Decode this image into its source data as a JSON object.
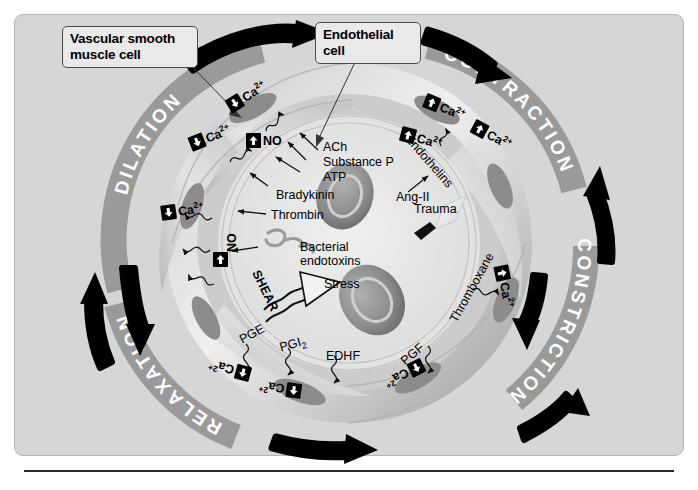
{
  "callouts": [
    {
      "id": "vsmc",
      "text": "Vascular smooth\nmuscle cell",
      "line1": "Vascular smooth",
      "line2": "muscle cell"
    },
    {
      "id": "endothelial",
      "text": "Endothelial\ncell",
      "line1": "Endothelial",
      "line2": "cell"
    }
  ],
  "ring_labels": [
    {
      "id": "dilation",
      "label": "DILATION"
    },
    {
      "id": "contraction",
      "label": "CONTRACTION"
    },
    {
      "id": "constriction",
      "label": "CONSTRICTION"
    },
    {
      "id": "relaxation",
      "label": "RELAXATION"
    }
  ],
  "vasodilator_mediators": [
    {
      "id": "ach",
      "label": "ACh"
    },
    {
      "id": "substance-p",
      "label": "Substance P"
    },
    {
      "id": "atp",
      "label": "ATP"
    },
    {
      "id": "bradykinin",
      "label": "Bradykinin"
    },
    {
      "id": "thrombin",
      "label": "Thrombin"
    },
    {
      "id": "bacterial-endotoxins-1",
      "label": "Bacterial"
    },
    {
      "id": "bacterial-endotoxins-2",
      "label": "endotoxins"
    },
    {
      "id": "shear",
      "label": "SHEAR"
    },
    {
      "id": "stress",
      "label": "Stress"
    }
  ],
  "vasodilator_products": [
    {
      "id": "pge",
      "label": "PGE"
    },
    {
      "id": "pgi2",
      "label": "PGI",
      "sub": "2"
    },
    {
      "id": "edhf",
      "label": "EDHF"
    },
    {
      "id": "no",
      "label": "NO"
    }
  ],
  "vasoconstrictor_mediators": [
    {
      "id": "ang-ii",
      "label": "Ang-II"
    },
    {
      "id": "trauma",
      "label": "Trauma"
    }
  ],
  "vasoconstrictor_products": [
    {
      "id": "endothelins",
      "label": "Endothelins"
    },
    {
      "id": "thromboxane",
      "label": "Thromboxane"
    },
    {
      "id": "pgf",
      "label": "PGF"
    }
  ],
  "calcium_badges": [
    {
      "id": "ca-top-left-1",
      "label": "Ca",
      "charge": "2+",
      "direction": "down"
    },
    {
      "id": "ca-top-left-2",
      "label": "Ca",
      "charge": "2+",
      "direction": "down"
    },
    {
      "id": "ca-left",
      "label": "Ca",
      "charge": "2+",
      "direction": "down"
    },
    {
      "id": "ca-bottom-left-1",
      "label": "Ca",
      "charge": "2+",
      "direction": "down"
    },
    {
      "id": "ca-bottom-left-2",
      "label": "Ca",
      "charge": "2+",
      "direction": "down"
    },
    {
      "id": "ca-top-right-1",
      "label": "Ca",
      "charge": "2+",
      "direction": "up"
    },
    {
      "id": "ca-top-right-2",
      "label": "Ca",
      "charge": "2+",
      "direction": "up"
    },
    {
      "id": "ca-right",
      "label": "Ca",
      "charge": "2+",
      "direction": "up"
    },
    {
      "id": "ca-bottom-right",
      "label": "Ca",
      "charge": "2+",
      "direction": "up"
    }
  ],
  "no_badges": [
    {
      "id": "no-upper",
      "label": "NO",
      "direction": "up"
    },
    {
      "id": "no-lower",
      "label": "NO",
      "direction": "up"
    }
  ],
  "colors": {
    "panel_background": "#d6d6d6",
    "ring_band": "#9a9a9a",
    "ring_text": "#ffffff",
    "vessel_wall_light": "#cfcfcf",
    "vessel_wall_mid": "#a8a8a8",
    "lumen": "#e6e6e6",
    "nucleus": "#8f8f8f",
    "rbc": "#8d8d8d",
    "arrow": "#000000",
    "callout_background": "#e9e9e9",
    "callout_border": "#4a4a4a"
  }
}
